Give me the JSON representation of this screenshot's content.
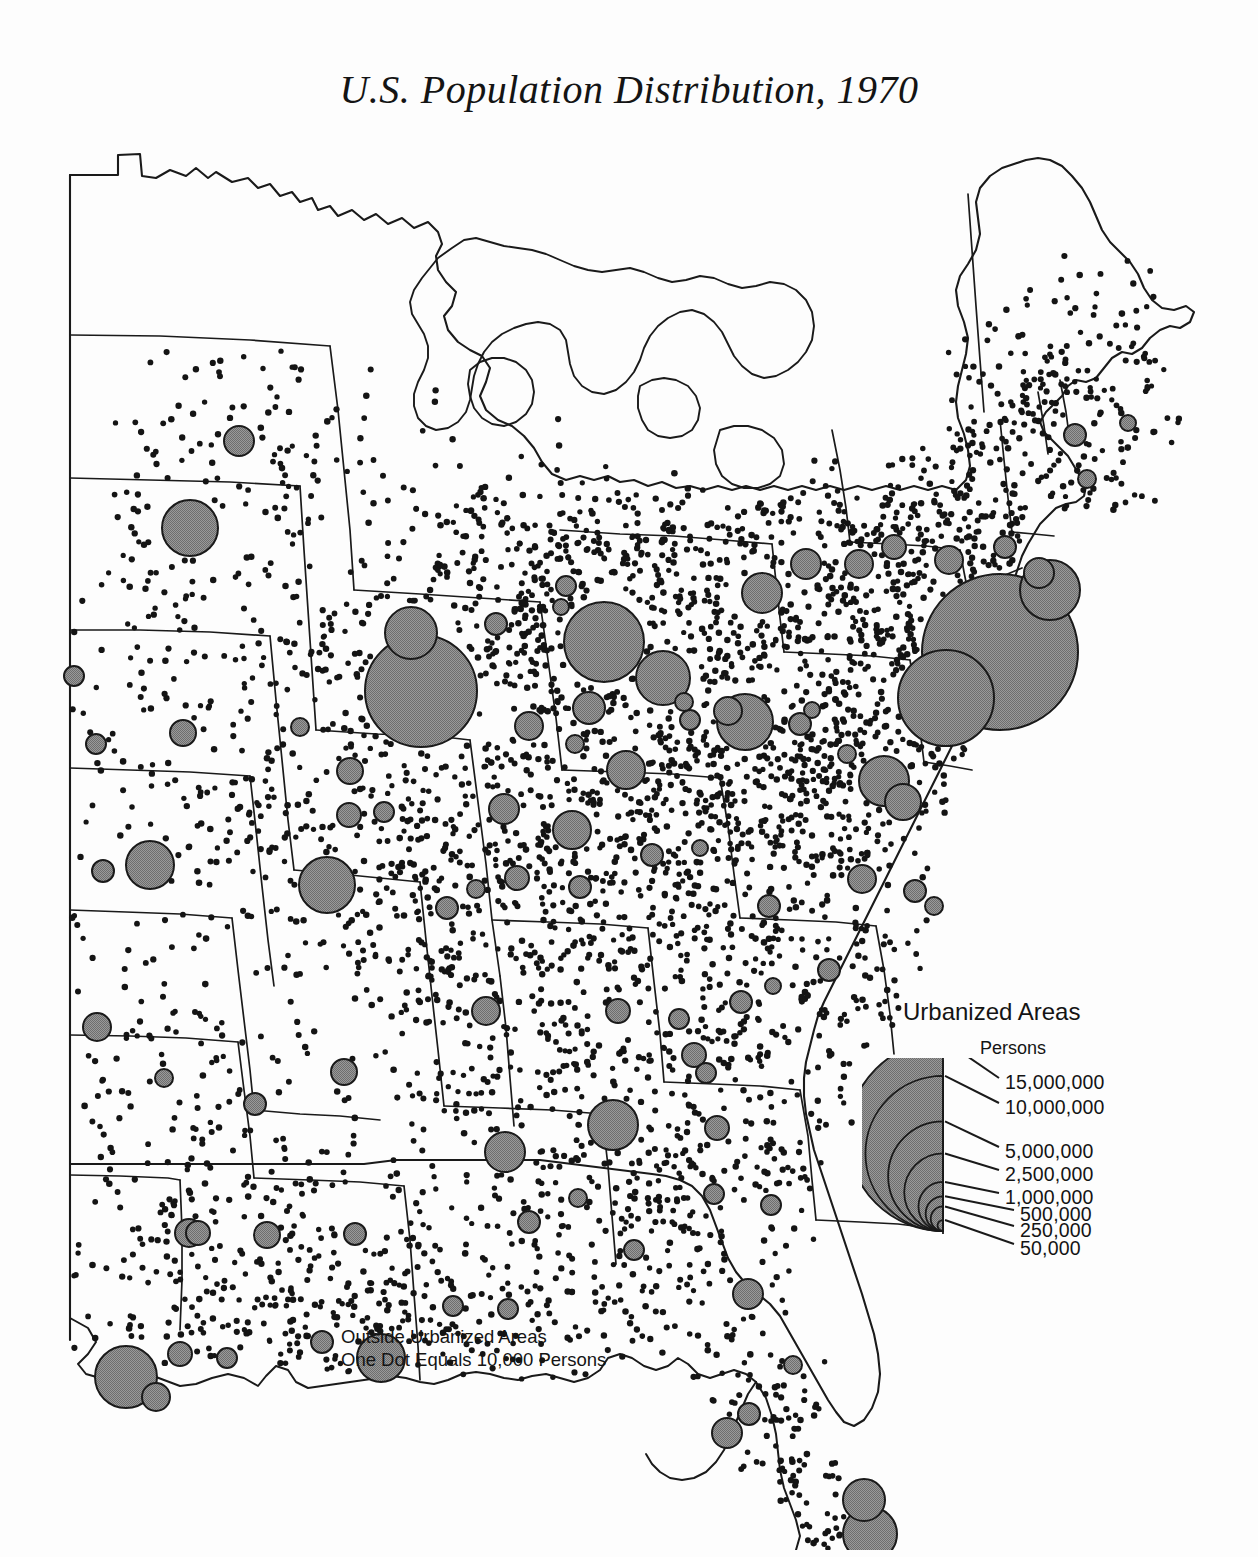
{
  "title": "U.S. Population Distribution, 1970",
  "legend": {
    "heading": "Urbanized Areas",
    "unit_label": "Persons",
    "classes": [
      {
        "label": "15,000,000",
        "value": 15000000
      },
      {
        "label": "10,000,000",
        "value": 10000000
      },
      {
        "label": "5,000,000",
        "value": 5000000
      },
      {
        "label": "2,500,000",
        "value": 2500000
      },
      {
        "label": "1,000,000",
        "value": 1000000
      },
      {
        "label": "500,000",
        "value": 500000
      },
      {
        "label": "250,000",
        "value": 250000
      },
      {
        "label": "50,000",
        "value": 50000
      }
    ]
  },
  "dot_note": {
    "line1": "Outside Urbanized Areas",
    "line2": "One Dot Equals 10,000 Persons"
  },
  "colors": {
    "background": "#fdfdfd",
    "ink": "#141414",
    "circle_fill": "#8b8b8b",
    "circle_stroke": "#1a1a1a",
    "coast_stroke": "#1a1a1a",
    "state_stroke": "#1a1a1a"
  },
  "chart_data": {
    "type": "map",
    "subtype": "dot-density-with-proportional-symbols",
    "title": "U.S. Population Distribution, 1970",
    "region": "Eastern and central United States",
    "dot_value_persons": 10000,
    "symbol_variable": "Urbanized area population (persons)",
    "legend_breaks": [
      15000000,
      10000000,
      5000000,
      2500000,
      1000000,
      500000,
      250000,
      50000
    ],
    "urbanized_areas": [
      {
        "x": 1000,
        "y": 522,
        "r": 78
      },
      {
        "x": 946,
        "y": 568,
        "r": 48
      },
      {
        "x": 421,
        "y": 561,
        "r": 56
      },
      {
        "x": 604,
        "y": 512,
        "r": 40
      },
      {
        "x": 411,
        "y": 503,
        "r": 26
      },
      {
        "x": 663,
        "y": 548,
        "r": 27
      },
      {
        "x": 190,
        "y": 398,
        "r": 28
      },
      {
        "x": 239,
        "y": 311,
        "r": 15
      },
      {
        "x": 745,
        "y": 592,
        "r": 28
      },
      {
        "x": 327,
        "y": 755,
        "r": 28
      },
      {
        "x": 150,
        "y": 735,
        "r": 24
      },
      {
        "x": 126,
        "y": 1247,
        "r": 31
      },
      {
        "x": 381,
        "y": 1228,
        "r": 24
      },
      {
        "x": 870,
        "y": 1404,
        "r": 27
      },
      {
        "x": 864,
        "y": 1370,
        "r": 21
      },
      {
        "x": 189,
        "y": 1103,
        "r": 14
      },
      {
        "x": 613,
        "y": 995,
        "r": 25
      },
      {
        "x": 505,
        "y": 1022,
        "r": 20
      },
      {
        "x": 1050,
        "y": 460,
        "r": 30
      },
      {
        "x": 884,
        "y": 651,
        "r": 25
      },
      {
        "x": 903,
        "y": 672,
        "r": 18
      },
      {
        "x": 762,
        "y": 463,
        "r": 20
      },
      {
        "x": 806,
        "y": 434,
        "r": 15
      },
      {
        "x": 859,
        "y": 434,
        "r": 14
      },
      {
        "x": 949,
        "y": 430,
        "r": 14
      },
      {
        "x": 894,
        "y": 417,
        "r": 12
      },
      {
        "x": 1005,
        "y": 417,
        "r": 11
      },
      {
        "x": 1039,
        "y": 443,
        "r": 15
      },
      {
        "x": 1075,
        "y": 305,
        "r": 11
      },
      {
        "x": 1087,
        "y": 349,
        "r": 9
      },
      {
        "x": 1128,
        "y": 293,
        "r": 8
      },
      {
        "x": 589,
        "y": 578,
        "r": 16
      },
      {
        "x": 529,
        "y": 596,
        "r": 14
      },
      {
        "x": 575,
        "y": 614,
        "r": 9
      },
      {
        "x": 626,
        "y": 640,
        "r": 19
      },
      {
        "x": 572,
        "y": 700,
        "r": 19
      },
      {
        "x": 504,
        "y": 679,
        "r": 15
      },
      {
        "x": 350,
        "y": 641,
        "r": 13
      },
      {
        "x": 349,
        "y": 685,
        "r": 12
      },
      {
        "x": 384,
        "y": 682,
        "r": 10
      },
      {
        "x": 300,
        "y": 597,
        "r": 9
      },
      {
        "x": 183,
        "y": 603,
        "r": 13
      },
      {
        "x": 74,
        "y": 546,
        "r": 10
      },
      {
        "x": 96,
        "y": 614,
        "r": 10
      },
      {
        "x": 103,
        "y": 741,
        "r": 11
      },
      {
        "x": 97,
        "y": 897,
        "r": 14
      },
      {
        "x": 164,
        "y": 948,
        "r": 9
      },
      {
        "x": 255,
        "y": 974,
        "r": 11
      },
      {
        "x": 198,
        "y": 1103,
        "r": 12
      },
      {
        "x": 267,
        "y": 1105,
        "r": 13
      },
      {
        "x": 355,
        "y": 1104,
        "r": 11
      },
      {
        "x": 227,
        "y": 1228,
        "r": 10
      },
      {
        "x": 180,
        "y": 1224,
        "r": 12
      },
      {
        "x": 156,
        "y": 1267,
        "r": 14
      },
      {
        "x": 322,
        "y": 1212,
        "r": 11
      },
      {
        "x": 453,
        "y": 1176,
        "r": 10
      },
      {
        "x": 508,
        "y": 1179,
        "r": 10
      },
      {
        "x": 344,
        "y": 942,
        "r": 13
      },
      {
        "x": 486,
        "y": 881,
        "r": 14
      },
      {
        "x": 618,
        "y": 881,
        "r": 12
      },
      {
        "x": 679,
        "y": 889,
        "r": 10
      },
      {
        "x": 741,
        "y": 872,
        "r": 11
      },
      {
        "x": 773,
        "y": 856,
        "r": 8
      },
      {
        "x": 829,
        "y": 840,
        "r": 11
      },
      {
        "x": 862,
        "y": 749,
        "r": 14
      },
      {
        "x": 915,
        "y": 761,
        "r": 11
      },
      {
        "x": 934,
        "y": 776,
        "r": 9
      },
      {
        "x": 694,
        "y": 925,
        "r": 12
      },
      {
        "x": 706,
        "y": 943,
        "r": 10
      },
      {
        "x": 769,
        "y": 776,
        "r": 11
      },
      {
        "x": 717,
        "y": 998,
        "r": 12
      },
      {
        "x": 714,
        "y": 1064,
        "r": 10
      },
      {
        "x": 771,
        "y": 1075,
        "r": 10
      },
      {
        "x": 634,
        "y": 1120,
        "r": 10
      },
      {
        "x": 529,
        "y": 1092,
        "r": 11
      },
      {
        "x": 578,
        "y": 1068,
        "r": 9
      },
      {
        "x": 748,
        "y": 1164,
        "r": 15
      },
      {
        "x": 727,
        "y": 1303,
        "r": 15
      },
      {
        "x": 749,
        "y": 1284,
        "r": 11
      },
      {
        "x": 793,
        "y": 1235,
        "r": 9
      },
      {
        "x": 728,
        "y": 581,
        "r": 14
      },
      {
        "x": 690,
        "y": 590,
        "r": 10
      },
      {
        "x": 684,
        "y": 572,
        "r": 9
      },
      {
        "x": 800,
        "y": 594,
        "r": 11
      },
      {
        "x": 812,
        "y": 580,
        "r": 8
      },
      {
        "x": 847,
        "y": 624,
        "r": 9
      },
      {
        "x": 496,
        "y": 494,
        "r": 11
      },
      {
        "x": 566,
        "y": 456,
        "r": 10
      },
      {
        "x": 561,
        "y": 477,
        "r": 8
      },
      {
        "x": 447,
        "y": 778,
        "r": 11
      },
      {
        "x": 476,
        "y": 759,
        "r": 9
      },
      {
        "x": 517,
        "y": 748,
        "r": 12
      },
      {
        "x": 580,
        "y": 757,
        "r": 11
      },
      {
        "x": 652,
        "y": 725,
        "r": 11
      },
      {
        "x": 700,
        "y": 718,
        "r": 8
      }
    ]
  }
}
